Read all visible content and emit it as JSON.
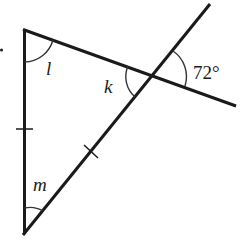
{
  "diagram": {
    "type": "geometry-triangle-with-transversal",
    "labels": {
      "angle_l": "l",
      "angle_k": "k",
      "angle_m": "m",
      "angle_given": "72°"
    },
    "colors": {
      "stroke": "#1a1a1a",
      "background": "#ffffff"
    },
    "vertices": {
      "top_left": [
        25,
        30
      ],
      "bottom": [
        24,
        233
      ],
      "intersection": [
        153,
        75
      ]
    },
    "equal_sides": [
      "left-side",
      "diagonal-side"
    ],
    "given_angle_degrees": 72
  }
}
